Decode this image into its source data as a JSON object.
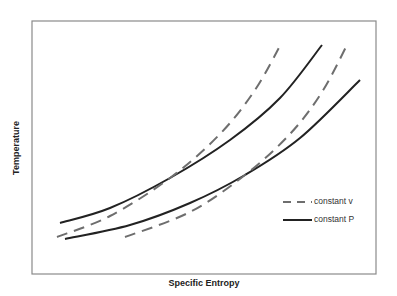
{
  "chart_data": {
    "type": "line",
    "title": "",
    "xlabel": "Specific Entropy",
    "ylabel": "Temperature",
    "grid": false,
    "ticks": false,
    "legend_position": "inside-lower-right",
    "legend": [
      {
        "label": "constant v",
        "style": "dashed",
        "color": "#6e6e6e"
      },
      {
        "label": "constant P",
        "style": "solid",
        "color": "#222222"
      }
    ],
    "series": [
      {
        "name": "constant P (upper)",
        "style": "solid",
        "color": "#222222",
        "points_px": [
          [
            60,
            223
          ],
          [
            110,
            208
          ],
          [
            170,
            178
          ],
          [
            230,
            140
          ],
          [
            280,
            98
          ],
          [
            322,
            45
          ]
        ]
      },
      {
        "name": "constant v (upper)",
        "style": "dashed",
        "color": "#6e6e6e",
        "points_px": [
          [
            57,
            237
          ],
          [
            110,
            216
          ],
          [
            170,
            178
          ],
          [
            220,
            134
          ],
          [
            255,
            90
          ],
          [
            281,
            44
          ]
        ]
      },
      {
        "name": "constant P (lower)",
        "style": "solid",
        "color": "#222222",
        "points_px": [
          [
            65,
            239
          ],
          [
            130,
            225
          ],
          [
            190,
            203
          ],
          [
            245,
            175
          ],
          [
            300,
            138
          ],
          [
            360,
            80
          ]
        ]
      },
      {
        "name": "constant v (lower)",
        "style": "dashed",
        "color": "#6e6e6e",
        "points_px": [
          [
            125,
            237
          ],
          [
            190,
            212
          ],
          [
            245,
            175
          ],
          [
            290,
            134
          ],
          [
            322,
            92
          ],
          [
            348,
            43
          ]
        ]
      }
    ],
    "annotations": []
  },
  "labels": {
    "x_axis": "Specific Entropy",
    "y_axis": "Temperature",
    "legend_v": "constant v",
    "legend_p": "constant P"
  },
  "colors": {
    "frame": "#8a8a8a",
    "solid": "#222222",
    "dashed": "#6e6e6e"
  }
}
